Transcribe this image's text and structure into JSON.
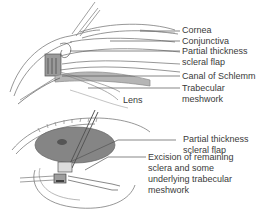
{
  "diagram": {
    "top_panel": {
      "labels": [
        {
          "id": "cornea",
          "text": "Cornea"
        },
        {
          "id": "conjunctiva",
          "text": "Conjunctiva"
        },
        {
          "id": "scleral-flap-1",
          "text": "Partial thickness"
        },
        {
          "id": "scleral-flap-2",
          "text": "scleral flap"
        },
        {
          "id": "canal",
          "text": "Canal of Schlemm"
        },
        {
          "id": "trabecular-1",
          "text": "Trabecular"
        },
        {
          "id": "trabecular-2",
          "text": "meshwork"
        },
        {
          "id": "lens",
          "text": "Lens"
        }
      ]
    },
    "bottom_panel": {
      "labels": [
        {
          "id": "flap-1",
          "text": "Partial thickness"
        },
        {
          "id": "flap-2",
          "text": "scleral flap"
        },
        {
          "id": "excision-1",
          "text": "Excision of remaining"
        },
        {
          "id": "excision-2",
          "text": "sclera and some"
        },
        {
          "id": "excision-3",
          "text": "underlying trabecular"
        },
        {
          "id": "excision-4",
          "text": "meshwork"
        }
      ]
    },
    "colors": {
      "line": "#555555",
      "tissue": "#bdbdbd",
      "iris": "#7a7a7a",
      "text": "#3a3a3a"
    }
  }
}
